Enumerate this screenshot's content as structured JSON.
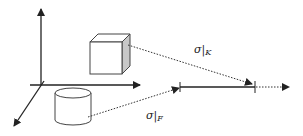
{
  "diagram": {
    "labels": {
      "sigma_k": {
        "symbol": "σ",
        "bar": "|",
        "sub": "K"
      },
      "sigma_f": {
        "symbol": "σ",
        "bar": "|",
        "sub": "F"
      }
    },
    "shapes": [
      "cube",
      "cylinder"
    ],
    "axes": [
      "vertical-axis",
      "horizontal-axis",
      "depth-axis"
    ],
    "colors": {
      "stroke": "#222222",
      "cube_side": "#c8c8c8",
      "fill": "#ffffff"
    }
  }
}
